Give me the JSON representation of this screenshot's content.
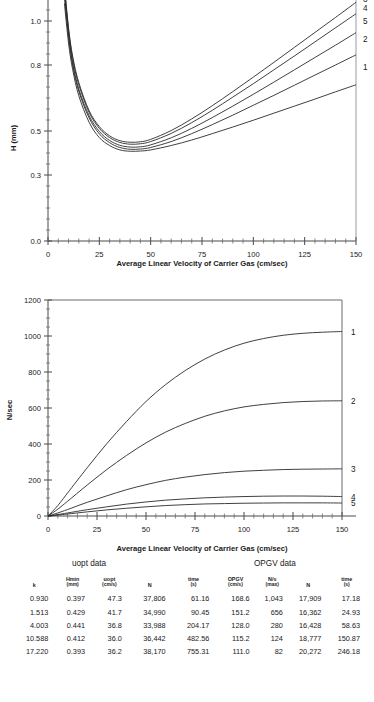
{
  "chart_data": [
    {
      "type": "line",
      "id": "van-deemter-plot",
      "title": "",
      "xlabel": "Average Linear Velocity of Carrier Gas (cm/sec)",
      "ylabel": "H (mm)",
      "xlim": [
        0,
        150
      ],
      "ylim": [
        0.0,
        1.15
      ],
      "xticks": [
        0,
        25,
        50,
        75,
        100,
        125,
        150
      ],
      "xticklabels": [
        "0",
        "25",
        "50",
        "75",
        "100",
        "125",
        "150"
      ],
      "yticks": [
        0.0,
        0.3,
        0.5,
        0.8,
        1.0
      ],
      "yticklabels": [
        "0.0",
        "0.3",
        "0.5",
        "0.8",
        "1.0"
      ],
      "grid": false,
      "legend_position": "right-edge-curve-labels",
      "x": [
        5,
        8,
        10,
        12,
        15,
        20,
        25,
        30,
        35,
        40,
        45,
        50,
        60,
        70,
        80,
        90,
        100,
        110,
        120,
        130,
        140,
        150
      ],
      "series": [
        {
          "name": "1",
          "label_y_at_150": 0.79,
          "values": [
            1.6,
            1.08,
            0.9,
            0.78,
            0.66,
            0.54,
            0.47,
            0.434,
            0.414,
            0.408,
            0.409,
            0.414,
            0.434,
            0.459,
            0.488,
            0.518,
            0.549,
            0.581,
            0.613,
            0.645,
            0.678,
            0.71
          ]
        },
        {
          "name": "2",
          "label_y_at_150": 0.92,
          "values": [
            1.64,
            1.11,
            0.93,
            0.8,
            0.68,
            0.56,
            0.487,
            0.447,
            0.425,
            0.417,
            0.418,
            0.425,
            0.452,
            0.488,
            0.529,
            0.572,
            0.617,
            0.662,
            0.708,
            0.754,
            0.8,
            0.846
          ]
        },
        {
          "name": "5",
          "label_y_at_150": 1.0,
          "values": [
            1.66,
            1.13,
            0.94,
            0.81,
            0.69,
            0.57,
            0.498,
            0.457,
            0.435,
            0.427,
            0.428,
            0.437,
            0.469,
            0.512,
            0.561,
            0.613,
            0.667,
            0.722,
            0.778,
            0.834,
            0.89,
            0.947
          ]
        },
        {
          "name": "4",
          "label_y_at_150": 1.06,
          "values": [
            1.68,
            1.15,
            0.96,
            0.83,
            0.71,
            0.585,
            0.512,
            0.47,
            0.448,
            0.44,
            0.442,
            0.452,
            0.489,
            0.538,
            0.594,
            0.654,
            0.715,
            0.778,
            0.841,
            0.905,
            0.969,
            1.033
          ]
        },
        {
          "name": "3",
          "label_y_at_150": 1.1,
          "values": [
            1.7,
            1.16,
            0.97,
            0.84,
            0.72,
            0.593,
            0.52,
            0.478,
            0.456,
            0.449,
            0.451,
            0.462,
            0.502,
            0.555,
            0.615,
            0.679,
            0.745,
            0.812,
            0.88,
            0.948,
            1.016,
            1.085
          ]
        }
      ]
    },
    {
      "type": "line",
      "id": "plates-per-second-plot",
      "title": "",
      "xlabel": "Average Linear Velocity of Carrier Gas (cm/sec)",
      "ylabel": "N/sec",
      "xlim": [
        0,
        150
      ],
      "ylim": [
        0,
        1200
      ],
      "xticks": [
        0,
        25,
        50,
        75,
        100,
        125,
        150
      ],
      "xticklabels": [
        "0",
        "25",
        "50",
        "75",
        "100",
        "125",
        "150"
      ],
      "yticks": [
        0,
        200,
        400,
        600,
        800,
        1000,
        1200
      ],
      "yticklabels": [
        "0",
        "200",
        "400",
        "600",
        "800",
        "1000",
        "1200"
      ],
      "grid": false,
      "legend_position": "right-edge-curve-labels",
      "x": [
        0,
        5,
        10,
        20,
        30,
        40,
        50,
        60,
        70,
        80,
        90,
        100,
        110,
        120,
        130,
        140,
        150
      ],
      "series": [
        {
          "name": "1",
          "label_y_at_150": 1025,
          "values": [
            0,
            58,
            128,
            268,
            402,
            524,
            636,
            730,
            808,
            872,
            922,
            960,
            986,
            1004,
            1015,
            1021,
            1025
          ]
        },
        {
          "name": "2",
          "label_y_at_150": 640,
          "values": [
            0,
            38,
            82,
            172,
            258,
            336,
            406,
            466,
            514,
            554,
            584,
            606,
            620,
            630,
            636,
            639,
            640
          ]
        },
        {
          "name": "3",
          "label_y_at_150": 262,
          "values": [
            0,
            17,
            36,
            76,
            112,
            146,
            174,
            198,
            216,
            230,
            241,
            249,
            254,
            258,
            260,
            261,
            262
          ]
        },
        {
          "name": "4",
          "label_y_at_150": 108,
          "values": [
            0,
            8,
            17,
            35,
            51,
            66,
            78,
            88,
            95,
            101,
            105,
            108,
            110,
            111,
            111,
            110,
            108
          ]
        },
        {
          "name": "5",
          "label_y_at_150": 72,
          "values": [
            0,
            5,
            11,
            23,
            34,
            43,
            51,
            58,
            63,
            67,
            69,
            71,
            72,
            73,
            73,
            73,
            72
          ]
        }
      ]
    }
  ],
  "chart1": {
    "ylabel": "H (mm)",
    "xlabel": "Average Linear Velocity of Carrier Gas (cm/sec)",
    "xticklabels": [
      "0",
      "25",
      "50",
      "75",
      "100",
      "125",
      "150"
    ],
    "yticklabels": [
      "0.0",
      "0.3",
      "0.5",
      "0.8",
      "1.0"
    ],
    "curve_labels": [
      "3",
      "4",
      "5",
      "2",
      "1"
    ]
  },
  "chart2": {
    "ylabel": "N/sec",
    "xlabel": "Average Linear Velocity of Carrier Gas (cm/sec)",
    "xticklabels": [
      "0",
      "25",
      "50",
      "75",
      "100",
      "125",
      "150"
    ],
    "yticklabels": [
      "1200",
      "1000",
      "800",
      "600",
      "400",
      "200",
      "0"
    ],
    "curve_labels": [
      "1",
      "2",
      "3",
      "4",
      "5"
    ]
  },
  "table": {
    "group_titles": {
      "left": "uopt data",
      "right": "OPGV data"
    },
    "headers": [
      {
        "name": "k",
        "unit": ""
      },
      {
        "name": "Hmin",
        "unit": "(mm)"
      },
      {
        "name": "uopt",
        "unit": "(cm/s)"
      },
      {
        "name": "N",
        "unit": ""
      },
      {
        "name": "time",
        "unit": "(s)"
      },
      {
        "name": "OPGV",
        "unit": "(cm/s)"
      },
      {
        "name": "N/s",
        "unit": "(max)"
      },
      {
        "name": "N",
        "unit": ""
      },
      {
        "name": "time",
        "unit": "(s)"
      }
    ],
    "rows": [
      [
        "0.930",
        "0.397",
        "47.3",
        "37,806",
        "61.16",
        "168.6",
        "1,043",
        "17,909",
        "17.18"
      ],
      [
        "1.513",
        "0.429",
        "41.7",
        "34,990",
        "90.45",
        "151.2",
        "656",
        "16,362",
        "24.93"
      ],
      [
        "4.003",
        "0.441",
        "36.8",
        "33,988",
        "204.17",
        "128.0",
        "280",
        "16,428",
        "58.63"
      ],
      [
        "10.588",
        "0.412",
        "36.0",
        "36,442",
        "482.56",
        "115.2",
        "124",
        "18,777",
        "150.87"
      ],
      [
        "17.220",
        "0.393",
        "36.2",
        "38,170",
        "755.31",
        "111.0",
        "82",
        "20,272",
        "246.18"
      ]
    ]
  },
  "colors": {
    "curve": "#2a2a2a",
    "axis": "#4a4a4a",
    "text": "#1a1a1a"
  }
}
